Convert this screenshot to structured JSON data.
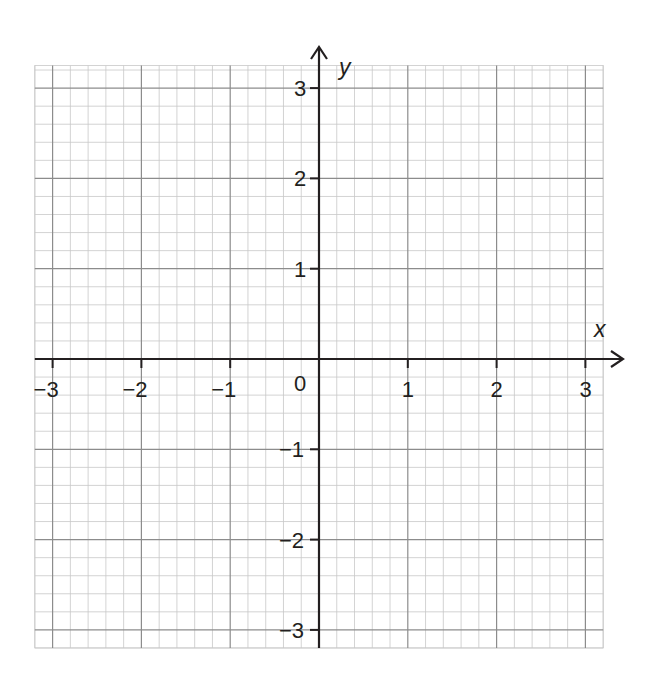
{
  "chart_data": {
    "type": "scatter",
    "title": "",
    "xlabel": "x",
    "ylabel": "y",
    "xlim": [
      -3.2,
      3.2
    ],
    "ylim": [
      -3.2,
      3.25
    ],
    "x_ticks": [
      -3,
      -2,
      -1,
      1,
      2,
      3
    ],
    "y_ticks": [
      3,
      2,
      1,
      -1,
      -2,
      -3
    ],
    "x_tick_labels": [
      "−3",
      "−2",
      "−1",
      "1",
      "2",
      "3"
    ],
    "y_tick_labels": [
      "3",
      "2",
      "1",
      "−1",
      "−2",
      "−3"
    ],
    "origin_label": "0",
    "grid": true,
    "minor_divisions_per_unit": 5,
    "series": [],
    "legend": null
  },
  "colors": {
    "axis": "#231f20",
    "major_grid": "#8c8c8c",
    "minor_grid": "#c8c8c8",
    "background": "#ffffff"
  }
}
